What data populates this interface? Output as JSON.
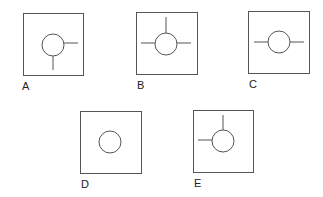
{
  "figures": [
    {
      "label": "A",
      "box": [
        23,
        13,
        60,
        62
      ],
      "circle": [
        53,
        45,
        11
      ],
      "lines": [
        [
          64,
          43,
          78,
          43
        ],
        [
          53,
          56,
          53,
          70
        ]
      ],
      "label_pos": [
        22,
        80
      ]
    },
    {
      "label": "B",
      "box": [
        136,
        12,
        61,
        62
      ],
      "circle": [
        166,
        44,
        11
      ],
      "lines": [
        [
          166,
          17,
          166,
          33
        ],
        [
          141,
          43,
          155,
          43
        ],
        [
          177,
          43,
          191,
          43
        ]
      ],
      "label_pos": [
        137,
        79
      ]
    },
    {
      "label": "C",
      "box": [
        248,
        11,
        61,
        62
      ],
      "circle": [
        279,
        42,
        11
      ],
      "lines": [
        [
          254,
          42,
          268,
          42
        ],
        [
          290,
          42,
          304,
          42
        ]
      ],
      "label_pos": [
        249,
        78
      ]
    },
    {
      "label": "D",
      "box": [
        80,
        111,
        61,
        62
      ],
      "circle": [
        110,
        142,
        11
      ],
      "lines": [],
      "label_pos": [
        81,
        178
      ]
    },
    {
      "label": "E",
      "box": [
        193,
        110,
        60,
        62
      ],
      "circle": [
        223,
        141,
        11
      ],
      "lines": [
        [
          223,
          115,
          223,
          130
        ],
        [
          198,
          140,
          212,
          140
        ]
      ],
      "label_pos": [
        194,
        177
      ]
    }
  ],
  "colors": {
    "stroke": "#555555",
    "label": "#222222"
  }
}
